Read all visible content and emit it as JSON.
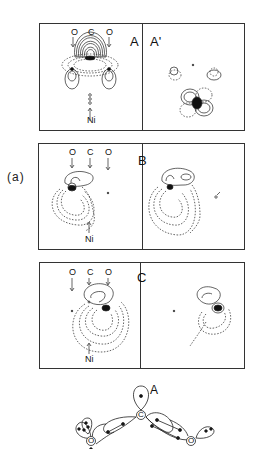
{
  "figure": {
    "side_label": "(a)",
    "panels": [
      {
        "id": "A",
        "left_label": "A",
        "right_label": "A'",
        "atoms_top": [
          "O",
          "C",
          "O"
        ],
        "atom_bottom": "Ni"
      },
      {
        "id": "B",
        "left_label": "",
        "right_label": "B",
        "atoms_top": [
          "O",
          "C",
          "O"
        ],
        "atom_bottom": "Ni"
      },
      {
        "id": "C",
        "left_label": "",
        "right_label": "C",
        "atoms_top": [
          "O",
          "C",
          "O"
        ],
        "atom_bottom": "Ni"
      }
    ],
    "schematic": {
      "label": "A",
      "atoms": [
        "C",
        "O",
        "O"
      ]
    }
  }
}
